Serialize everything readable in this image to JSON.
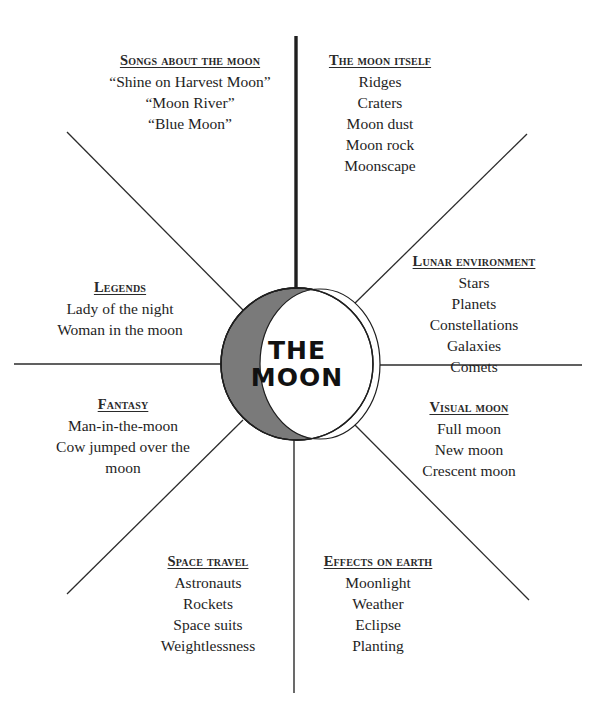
{
  "diagram": {
    "center": {
      "line1": "THE",
      "line2": "MOON"
    },
    "colors": {
      "line": "#2b2b2b",
      "crescent_fill": "#7a7a7a",
      "circle_fill": "#ffffff",
      "text": "#1e1e1e"
    },
    "branches": [
      {
        "heading": "Songs about the moon",
        "items": [
          "“Shine on Harvest Moon”",
          "“Moon River”",
          "“Blue Moon”"
        ]
      },
      {
        "heading": "The moon itself",
        "items": [
          "Ridges",
          "Craters",
          "Moon dust",
          "Moon rock",
          "Moonscape"
        ]
      },
      {
        "heading": "Lunar environment",
        "items": [
          "Stars",
          "Planets",
          "Constellations",
          "Galaxies",
          "Comets"
        ]
      },
      {
        "heading": "Visual moon",
        "items": [
          "Full moon",
          "New moon",
          "Crescent moon"
        ]
      },
      {
        "heading": "Effects on earth",
        "items": [
          "Moonlight",
          "Weather",
          "Eclipse",
          "Planting"
        ]
      },
      {
        "heading": "Space travel",
        "items": [
          "Astronauts",
          "Rockets",
          "Space suits",
          "Weightlessness"
        ]
      },
      {
        "heading": "Fantasy",
        "items": [
          "Man-in-the-moon",
          "Cow jumped over the",
          "moon"
        ]
      },
      {
        "heading": "Legends",
        "items": [
          "Lady of the night",
          "Woman in the moon"
        ]
      }
    ]
  }
}
